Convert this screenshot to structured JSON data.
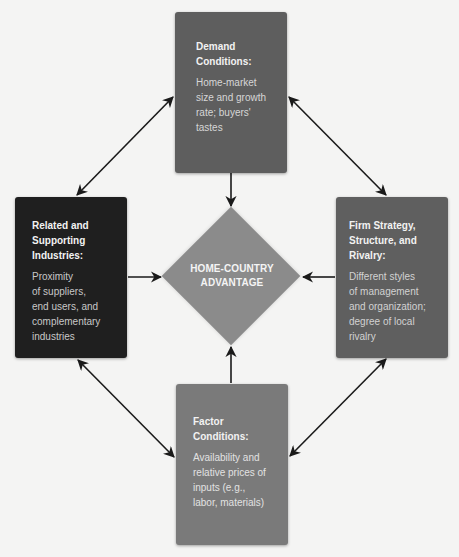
{
  "diagram": {
    "center": {
      "label": "HOME-COUNTRY\nADVANTAGE",
      "color": "#8b8b8b"
    },
    "boxes": {
      "demand": {
        "title": "Demand\nConditions:",
        "body": "Home-market\nsize and growth\nrate; buyers'\ntastes",
        "color": "#5e5e5e"
      },
      "related": {
        "title": "Related and\nSupporting\nIndustries:",
        "body": "Proximity\nof suppliers,\nend users, and\ncomplementary\nindustries",
        "color": "#1f1f1f"
      },
      "firm": {
        "title": "Firm Strategy,\nStructure, and\nRivalry:",
        "body": "Different styles\nof management\nand organization;\ndegree of local\nrivalry",
        "color": "#5f5f5f"
      },
      "factor": {
        "title": "Factor\nConditions:",
        "body": "Availability and\nrelative prices of\ninputs (e.g.,\nlabor, materials)",
        "color": "#7a7a7a"
      }
    },
    "connections": [
      {
        "from": "demand",
        "to": "center",
        "type": "one-way"
      },
      {
        "from": "related",
        "to": "center",
        "type": "one-way"
      },
      {
        "from": "firm",
        "to": "center",
        "type": "one-way"
      },
      {
        "from": "factor",
        "to": "center",
        "type": "one-way"
      },
      {
        "from": "demand",
        "to": "related",
        "type": "two-way"
      },
      {
        "from": "demand",
        "to": "firm",
        "type": "two-way"
      },
      {
        "from": "factor",
        "to": "related",
        "type": "two-way"
      },
      {
        "from": "factor",
        "to": "firm",
        "type": "two-way"
      }
    ]
  }
}
